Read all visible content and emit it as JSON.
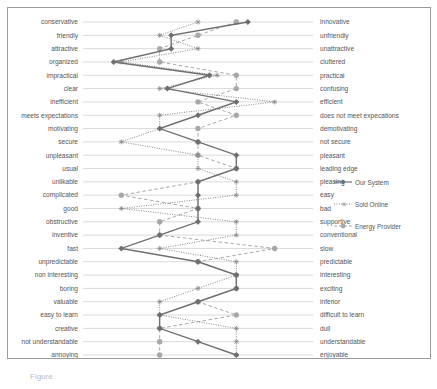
{
  "chart_data": {
    "type": "line",
    "orientation": "horizontal-profile",
    "title": "",
    "xlabel": "",
    "ylabel": "",
    "xlim": [
      1,
      7
    ],
    "x_ticks": [
      "1",
      "2",
      "3",
      "4",
      "5",
      "6",
      "7"
    ],
    "grid": true,
    "legend_position": "right",
    "left_labels": [
      "conservative",
      "friendly",
      "attractive",
      "organized",
      "impractical",
      "clear",
      "inefficient",
      "meets expectations",
      "motivating",
      "secure",
      "unpleasant",
      "usual",
      "unlikable",
      "complicated",
      "good",
      "obstructive",
      "inventive",
      "fast",
      "unpredictable",
      "non interesting",
      "boring",
      "valuable",
      "easy to learn",
      "creative",
      "not understandable",
      "annoying"
    ],
    "right_labels": [
      "innovative",
      "unfriendly",
      "unattractive",
      "cluttered",
      "practical",
      "confusing",
      "efficient",
      "does not meet  expecations",
      "demotivating",
      "not secure",
      "pleasant",
      "leading edge",
      "pleasing",
      "easy",
      "bad",
      "supportive",
      "conventional",
      "slow",
      "predictable",
      "interesting",
      "exciting",
      "inferior",
      "difficult to learn",
      "dull",
      "understandable",
      "enjoyable"
    ],
    "series": [
      {
        "name": "Our System",
        "style": "solid",
        "marker": "diamond",
        "color": "#6e6e6e",
        "values": [
          5.3,
          3.3,
          3.3,
          1.8,
          4.3,
          3.2,
          5,
          4,
          3,
          4,
          5,
          5,
          4,
          4,
          4,
          4,
          3,
          2,
          4,
          5,
          5,
          4,
          3,
          3,
          4,
          5
        ]
      },
      {
        "name": "Sold Online",
        "style": "dotted",
        "marker": "asterisk",
        "color": "#8a8a8a",
        "values": [
          4,
          3,
          4,
          2,
          4.5,
          3,
          6,
          3,
          3,
          2,
          4,
          4,
          5,
          5,
          2,
          5,
          5,
          3,
          5,
          5,
          4,
          3,
          3,
          5,
          5,
          5
        ]
      },
      {
        "name": "Energy Provider",
        "style": "dashed",
        "marker": "circle",
        "color": "#a8a8a8",
        "values": [
          5,
          4,
          3,
          3,
          5,
          5,
          4,
          5,
          4,
          4,
          4,
          5,
          4,
          2,
          4,
          3,
          3,
          6,
          4,
          5,
          5,
          4,
          5,
          3,
          3,
          3
        ]
      }
    ]
  },
  "legend": {
    "items": [
      {
        "label": "Our System"
      },
      {
        "label": "Sold Online"
      },
      {
        "label": "Energy Provider"
      }
    ]
  },
  "caption": "Figure"
}
